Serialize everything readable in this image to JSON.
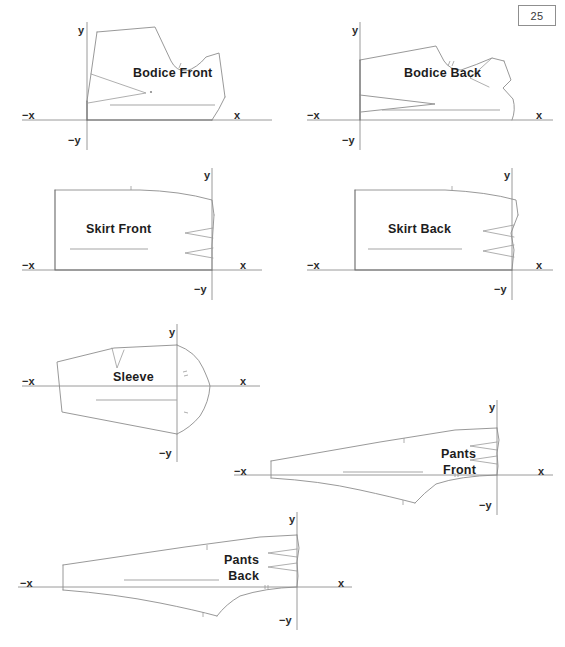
{
  "page": {
    "number": "25",
    "background_color": "#ffffff",
    "line_color": "#8d8d8d",
    "axis_color": "#9a9a9a",
    "text_color": "#1d1d1d"
  },
  "axis_labels": {
    "x": "x",
    "neg_x": "−x",
    "y": "y",
    "neg_y": "−y"
  },
  "figures": [
    {
      "id": "bodice-front",
      "label": "Bodice Front",
      "label_lines": [
        "Bodice Front"
      ],
      "quadrant": "upper-right",
      "origin": {
        "x": 87,
        "y": 120
      },
      "x_axis": {
        "x1": 22,
        "y1": 120,
        "x2": 272,
        "y2": 120
      },
      "y_axis": {
        "x1": 87,
        "y1": 22,
        "x2": 87,
        "y2": 150
      },
      "label_pos": {
        "x": 133,
        "y": 66
      },
      "axis_label_pos": {
        "x": {
          "x": 234,
          "y": 110
        },
        "neg_x": {
          "x": 22,
          "y": 110
        },
        "y": {
          "x": 78,
          "y": 25
        },
        "neg_y": {
          "x": 68,
          "y": 135
        }
      }
    },
    {
      "id": "bodice-back",
      "label": "Bodice Back",
      "label_lines": [
        "Bodice Back"
      ],
      "quadrant": "upper-right",
      "origin": {
        "x": 360,
        "y": 120
      },
      "x_axis": {
        "x1": 307,
        "y1": 120,
        "x2": 553,
        "y2": 120
      },
      "y_axis": {
        "x1": 360,
        "y1": 22,
        "x2": 360,
        "y2": 150
      },
      "label_pos": {
        "x": 404,
        "y": 66
      },
      "axis_label_pos": {
        "x": {
          "x": 536,
          "y": 110
        },
        "neg_x": {
          "x": 307,
          "y": 110
        },
        "y": {
          "x": 352,
          "y": 25
        },
        "neg_y": {
          "x": 342,
          "y": 135
        }
      }
    },
    {
      "id": "skirt-front",
      "label": "Skirt Front",
      "label_lines": [
        "Skirt Front"
      ],
      "quadrant": "upper-left",
      "origin": {
        "x": 212,
        "y": 270
      },
      "x_axis": {
        "x1": 22,
        "y1": 270,
        "x2": 262,
        "y2": 270
      },
      "y_axis": {
        "x1": 212,
        "y1": 168,
        "x2": 212,
        "y2": 300
      },
      "label_pos": {
        "x": 86,
        "y": 222
      },
      "axis_label_pos": {
        "x": {
          "x": 240,
          "y": 260
        },
        "neg_x": {
          "x": 22,
          "y": 260
        },
        "y": {
          "x": 204,
          "y": 170
        },
        "neg_y": {
          "x": 194,
          "y": 284
        }
      }
    },
    {
      "id": "skirt-back",
      "label": "Skirt Back",
      "label_lines": [
        "Skirt Back"
      ],
      "quadrant": "upper-left",
      "origin": {
        "x": 512,
        "y": 270
      },
      "x_axis": {
        "x1": 307,
        "y1": 270,
        "x2": 553,
        "y2": 270
      },
      "y_axis": {
        "x1": 512,
        "y1": 168,
        "x2": 512,
        "y2": 300
      },
      "label_pos": {
        "x": 388,
        "y": 222
      },
      "axis_label_pos": {
        "x": {
          "x": 536,
          "y": 260
        },
        "neg_x": {
          "x": 307,
          "y": 260
        },
        "y": {
          "x": 504,
          "y": 170
        },
        "neg_y": {
          "x": 494,
          "y": 284
        }
      }
    },
    {
      "id": "sleeve",
      "label": "Sleeve",
      "label_lines": [
        "Sleeve"
      ],
      "quadrant": "straddle-x",
      "origin": {
        "x": 177,
        "y": 386
      },
      "x_axis": {
        "x1": 22,
        "y1": 386,
        "x2": 260,
        "y2": 386
      },
      "y_axis": {
        "x1": 177,
        "y1": 324,
        "x2": 177,
        "y2": 462
      },
      "label_pos": {
        "x": 113,
        "y": 370
      },
      "axis_label_pos": {
        "x": {
          "x": 240,
          "y": 376
        },
        "neg_x": {
          "x": 22,
          "y": 376
        },
        "y": {
          "x": 169,
          "y": 327
        },
        "neg_y": {
          "x": 159,
          "y": 448
        }
      }
    },
    {
      "id": "pants-front",
      "label": "Pants Front",
      "label_lines": [
        "Pants",
        "Front"
      ],
      "quadrant": "upper-left",
      "origin": {
        "x": 737,
        "y": 0
      },
      "x_axis": {
        "x1": 234,
        "y1": 475,
        "x2": 553,
        "y2": 475
      },
      "y_axis": {
        "x1": 497,
        "y1": 400,
        "x2": 497,
        "y2": 515
      },
      "label_pos": {
        "x": 441,
        "y": 447
      },
      "axis_label_pos": {
        "x": {
          "x": 538,
          "y": 466
        },
        "neg_x": {
          "x": 234,
          "y": 466
        },
        "y": {
          "x": 489,
          "y": 402
        },
        "neg_y": {
          "x": 479,
          "y": 500
        }
      }
    },
    {
      "id": "pants-back",
      "label": "Pants Back",
      "label_lines": [
        "Pants",
        "Back"
      ],
      "quadrant": "upper-left",
      "origin": {
        "x": 297,
        "y": 587
      },
      "x_axis": {
        "x1": 18,
        "y1": 587,
        "x2": 352,
        "y2": 587
      },
      "y_axis": {
        "x1": 297,
        "y1": 512,
        "x2": 297,
        "y2": 630
      },
      "label_pos": {
        "x": 224,
        "y": 553
      },
      "axis_label_pos": {
        "x": {
          "x": 338,
          "y": 578
        },
        "neg_x": {
          "x": 20,
          "y": 578
        },
        "y": {
          "x": 289,
          "y": 514
        },
        "neg_y": {
          "x": 279,
          "y": 615
        }
      }
    }
  ]
}
